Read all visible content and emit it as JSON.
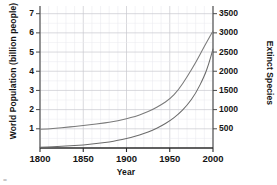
{
  "chart_data": {
    "type": "line",
    "title": "",
    "xlabel": "Year",
    "ylabel": "World Population (billion people)",
    "ylabel_right": "Extinct Species",
    "xlim": [
      1800,
      2000
    ],
    "ylim": [
      0,
      7.4
    ],
    "ylim_right": [
      0,
      3700
    ],
    "grid": true,
    "legend": "none",
    "xticks": [
      "1800",
      "1850",
      "1900",
      "1950",
      "2000"
    ],
    "xtick_values": [
      1800,
      1850,
      1900,
      1950,
      2000
    ],
    "yticks_left": [
      "1",
      "2",
      "3",
      "4",
      "5",
      "6",
      "7"
    ],
    "ytick_values_left": [
      1,
      2,
      3,
      4,
      5,
      6,
      7
    ],
    "yticks_right": [
      "500",
      "1000",
      "1500",
      "2000",
      "2500",
      "3000",
      "3500"
    ],
    "ytick_values_right": [
      500,
      1000,
      1500,
      2000,
      2500,
      3000,
      3500
    ],
    "series": [
      {
        "name": "World Population (billion people)",
        "axis": "left",
        "color": "#7a7a7a",
        "x": [
          1800,
          1810,
          1820,
          1830,
          1840,
          1850,
          1860,
          1870,
          1880,
          1890,
          1900,
          1910,
          1920,
          1930,
          1940,
          1950,
          1960,
          1970,
          1980,
          1990,
          1995,
          2000
        ],
        "values": [
          0.98,
          1.0,
          1.04,
          1.08,
          1.12,
          1.17,
          1.22,
          1.28,
          1.34,
          1.42,
          1.52,
          1.65,
          1.8,
          2.0,
          2.25,
          2.55,
          3.02,
          3.7,
          4.45,
          5.3,
          5.7,
          6.1
        ]
      },
      {
        "name": "Extinct Species",
        "axis": "right",
        "color": "#6b6b6b",
        "x": [
          1800,
          1810,
          1820,
          1830,
          1840,
          1850,
          1860,
          1870,
          1880,
          1890,
          1900,
          1910,
          1920,
          1930,
          1940,
          1950,
          1960,
          1970,
          1980,
          1990,
          1995,
          2000
        ],
        "values": [
          20,
          28,
          38,
          50,
          65,
          82,
          103,
          128,
          158,
          196,
          243,
          300,
          372,
          460,
          570,
          706,
          880,
          1110,
          1420,
          1870,
          2180,
          2580
        ]
      }
    ]
  },
  "labels": {
    "xlabel": "Year",
    "ylabel_left": "World Population (billion people)",
    "ylabel_right": "Extinct Species"
  }
}
